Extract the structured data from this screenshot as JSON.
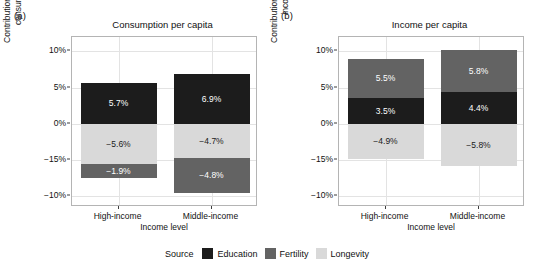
{
  "figure": {
    "legend": {
      "title": "Source",
      "items": [
        {
          "label": "Education",
          "color": "#1c1c1c"
        },
        {
          "label": "Fertility",
          "color": "#636363"
        },
        {
          "label": "Longevity",
          "color": "#d9d9d9"
        }
      ]
    }
  },
  "chart_data": [
    {
      "type": "bar",
      "panel_tag": "(a)",
      "title": "Consumption per capita",
      "xlabel": "Income level",
      "ylabel": "Contribution to the growth rate of consumption per capita",
      "ylabel_line1": "Contribution to the growth rate of",
      "ylabel_line2": "consumption per capita",
      "categories": [
        "High-income",
        "Middle-income"
      ],
      "ytick_labels": [
        "10%",
        "5%",
        "0%",
        "−15%",
        "−10%"
      ],
      "ytick_values": [
        10,
        5,
        0,
        -5,
        -10
      ],
      "ylim": [
        -11.5,
        12.0
      ],
      "grid": true,
      "legend_position": "bottom",
      "stacked": true,
      "series": [
        {
          "name": "Education",
          "color": "#1c1c1c",
          "values": [
            5.7,
            6.9
          ],
          "labels": [
            "5.7%",
            "6.9%"
          ]
        },
        {
          "name": "Longevity",
          "color": "#d9d9d9",
          "values": [
            -5.6,
            -4.7
          ],
          "labels": [
            "−5.6%",
            "−4.7%"
          ]
        },
        {
          "name": "Fertility",
          "color": "#636363",
          "values": [
            -1.9,
            -4.8
          ],
          "labels": [
            "−1.9%",
            "−4.8%"
          ]
        }
      ]
    },
    {
      "type": "bar",
      "panel_tag": "(b)",
      "title": "Income per capita",
      "xlabel": "Income level",
      "ylabel": "Contribution to the growth rate of income per capita",
      "ylabel_line1": "Contribution to the growth rate of",
      "ylabel_line2": "income per capita",
      "categories": [
        "High-income",
        "Middle-income"
      ],
      "ytick_labels": [
        "10%",
        "5%",
        "0%",
        "−15%",
        "−10%"
      ],
      "ytick_values": [
        10,
        5,
        0,
        -5,
        -10
      ],
      "ylim": [
        -11.5,
        12.0
      ],
      "grid": true,
      "legend_position": "bottom",
      "stacked": true,
      "series": [
        {
          "name": "Education",
          "color": "#1c1c1c",
          "values": [
            3.5,
            4.4
          ],
          "labels": [
            "3.5%",
            "4.4%"
          ]
        },
        {
          "name": "Fertility",
          "color": "#636363",
          "values": [
            5.5,
            5.8
          ],
          "labels": [
            "5.5%",
            "5.8%"
          ]
        },
        {
          "name": "Longevity",
          "color": "#d9d9d9",
          "values": [
            -4.9,
            -5.8
          ],
          "labels": [
            "−4.9%",
            "−5.8%"
          ]
        }
      ]
    }
  ]
}
